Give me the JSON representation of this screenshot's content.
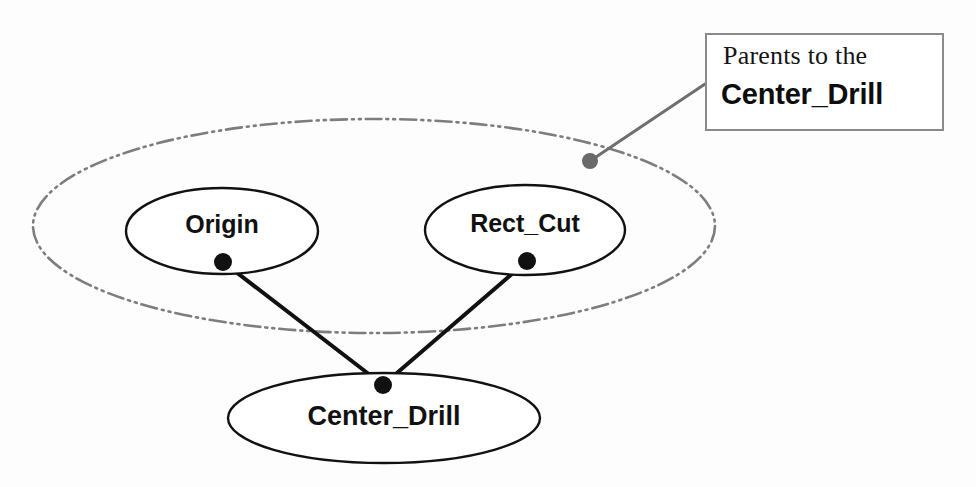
{
  "figure": {
    "type": "node-relationship-diagram",
    "background_color": "#fdfdfd"
  },
  "grouping_region": {
    "name": "parents-group-ellipse",
    "style": "dash-dot-dot",
    "stroke_color": "#7d7d7d",
    "center_x": 374,
    "center_y": 226,
    "radius_x": 341,
    "radius_y": 107
  },
  "nodes": [
    {
      "id": "origin",
      "label": "Origin",
      "center_x": 222,
      "center_y": 231,
      "radius_x": 96,
      "radius_y": 43,
      "font_size": 25,
      "stroke_color": "#111111",
      "fill_color": "#ffffff",
      "port_x": 223,
      "port_y": 262,
      "port_color": "#111111"
    },
    {
      "id": "rect_cut",
      "label": "Rect_Cut",
      "center_x": 525,
      "center_y": 230,
      "radius_x": 100,
      "radius_y": 45,
      "font_size": 25,
      "stroke_color": "#111111",
      "fill_color": "#ffffff",
      "port_x": 527,
      "port_y": 261,
      "port_color": "#111111"
    },
    {
      "id": "center_drill",
      "label": "Center_Drill",
      "center_x": 384,
      "center_y": 418,
      "radius_x": 156,
      "radius_y": 45,
      "font_size": 27,
      "stroke_color": "#111111",
      "fill_color": "#ffffff",
      "port_x": 383,
      "port_y": 385,
      "port_color": "#111111"
    }
  ],
  "edges": [
    {
      "id": "edge-origin-center-drill",
      "from": "origin",
      "to": "center_drill",
      "x1": 223,
      "y1": 262,
      "x2": 383,
      "y2": 385,
      "stroke_color": "#111111",
      "stroke_width": 4
    },
    {
      "id": "edge-rect-cut-center-drill",
      "from": "rect_cut",
      "to": "center_drill",
      "x1": 527,
      "y1": 261,
      "x2": 383,
      "y2": 385,
      "stroke_color": "#111111",
      "stroke_width": 4
    }
  ],
  "callout": {
    "line_1": "Parents to the",
    "line_2": "Center_Drill",
    "box": {
      "x": 705,
      "y": 33,
      "width": 239,
      "height": 98
    },
    "border_color": "#8a8a8a",
    "leader": {
      "from_x": 705,
      "from_y": 84,
      "to_x": 596,
      "to_y": 157,
      "stroke_color": "#6f6f6f",
      "stroke_width": 3,
      "anchor_dot_x": 590,
      "anchor_dot_y": 161,
      "anchor_dot_radius": 8,
      "anchor_dot_color": "#6a6a6a"
    }
  }
}
